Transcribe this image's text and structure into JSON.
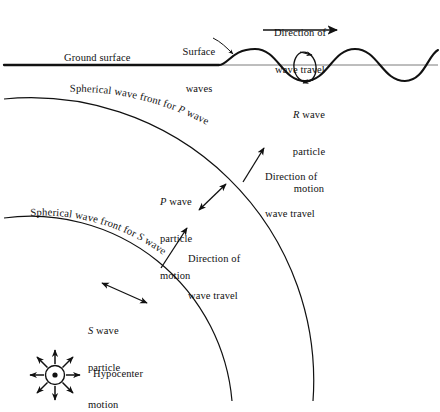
{
  "figure": {
    "background_color": "#ffffff",
    "ink_color": "#111111",
    "width": 440,
    "height": 401
  },
  "labels": {
    "ground_surface": "Ground surface",
    "surface_waves_line1": "Surface",
    "surface_waves_line2": "waves",
    "direction_top_line1": "Direction of",
    "direction_top_line2": "wave travel",
    "r_wave_line1": "R wave",
    "r_wave_line2": "particle",
    "r_wave_line3": "motion",
    "r_wave_italic": "R",
    "p_front": "Spherical wave front for P wave",
    "p_front_prefix": "Spherical wave front for ",
    "p_front_italic": "P",
    "p_front_suffix": " wave",
    "s_front": "Spherical wave front for S wave",
    "s_front_prefix": "Spherical wave front for ",
    "s_front_italic": "S",
    "s_front_suffix": " wave",
    "direction_p_line1": "Direction of",
    "direction_p_line2": "wave travel",
    "direction_s_line1": "Direction of",
    "direction_s_line2": "wave travel",
    "p_particle_line1": "P wave",
    "p_particle_line2": "particle",
    "p_particle_line3": "motion",
    "p_particle_italic": "P",
    "s_particle_line1": "S wave",
    "s_particle_line2": "particle",
    "s_particle_line3": "motion",
    "s_particle_italic": "S",
    "hypocenter": "Hypocenter"
  },
  "icons": {
    "arrow_travel_top": "right-arrow-icon",
    "arrow_p_travel": "diagonal-arrow-icon",
    "arrow_s_travel": "diagonal-arrow-icon",
    "arrow_p_particle": "double-headed-arrow-icon",
    "arrow_s_particle": "double-headed-arrow-icon",
    "hypocenter_burst": "radiating-burst-icon",
    "r_wave_ellipse": "retrograde-ellipse-icon",
    "leader_surface_waves": "leader-line-icon"
  },
  "geometry": {
    "hypocenter": {
      "x": 55,
      "y": 375
    },
    "p_front_radius": 283,
    "s_front_radius": 202,
    "ground_surface_y": 65,
    "surface_wave_start_x": 218,
    "surface_wave_amplitude": 16,
    "surface_wave_wavelength": 74,
    "top_arrow": {
      "x1": 263,
      "y1": 30,
      "x2": 339,
      "y2": 30
    }
  }
}
